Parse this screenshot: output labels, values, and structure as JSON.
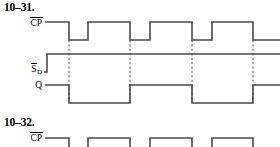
{
  "problems": [
    {
      "number": "10–31.",
      "signals": [
        {
          "name": "cp",
          "base": "CP",
          "overbar": true,
          "subscript": ""
        },
        {
          "name": "sd",
          "base": "S",
          "overbar": true,
          "subscript": "D"
        },
        {
          "name": "q",
          "base": "Q",
          "overbar": false,
          "subscript": ""
        }
      ]
    },
    {
      "number": "10–32.",
      "signals": [
        {
          "name": "cp",
          "base": "CP",
          "overbar": true,
          "subscript": ""
        }
      ]
    }
  ],
  "chart_data": {
    "type": "line",
    "title": "10–31.",
    "xlabel": "",
    "ylabel": "",
    "xlim": [
      40,
      280
    ],
    "grid": false,
    "legend": false,
    "edge_marker_x": [
      69,
      130,
      192,
      253
    ],
    "series": [
      {
        "name": "CP̅",
        "label": "CP-bar",
        "row_high_y": 22,
        "row_low_y": 40,
        "start_x": 45,
        "end_x": 280,
        "levels": [
          {
            "x": 45,
            "level": 1
          },
          {
            "x": 69,
            "level": 0
          },
          {
            "x": 88,
            "level": 1
          },
          {
            "x": 130,
            "level": 0
          },
          {
            "x": 150,
            "level": 1
          },
          {
            "x": 192,
            "level": 0
          },
          {
            "x": 212,
            "level": 1
          },
          {
            "x": 253,
            "level": 0
          }
        ]
      },
      {
        "name": "S̅D",
        "label": "S-D-bar",
        "row_high_y": 54,
        "row_low_y": 72,
        "start_x": 44,
        "end_x": 280,
        "levels": [
          {
            "x": 44,
            "level": 0
          },
          {
            "x": 47,
            "level": 1
          }
        ]
      },
      {
        "name": "Q",
        "label": "Q",
        "row_high_y": 85,
        "row_low_y": 103,
        "start_x": 45,
        "end_x": 280,
        "levels": [
          {
            "x": 45,
            "level": 1
          },
          {
            "x": 69,
            "level": 0
          },
          {
            "x": 130,
            "level": 1
          },
          {
            "x": 192,
            "level": 0
          },
          {
            "x": 253,
            "level": 1
          }
        ]
      }
    ],
    "second_chart": {
      "type": "line",
      "title": "10–32.",
      "series": [
        {
          "name": "CP̅",
          "label": "CP-bar",
          "row_high_y": 138,
          "row_low_y": 152,
          "start_x": 45,
          "end_x": 280,
          "levels": [
            {
              "x": 45,
              "level": 1
            },
            {
              "x": 69,
              "level": 0
            },
            {
              "x": 88,
              "level": 1
            },
            {
              "x": 130,
              "level": 0
            },
            {
              "x": 150,
              "level": 1
            },
            {
              "x": 192,
              "level": 0
            },
            {
              "x": 212,
              "level": 1
            },
            {
              "x": 253,
              "level": 0
            }
          ]
        }
      ]
    },
    "colors": {
      "trace": "#4a4a4a",
      "edge_marker": "#555555",
      "text": "#000000",
      "background": "#ffffff"
    }
  }
}
